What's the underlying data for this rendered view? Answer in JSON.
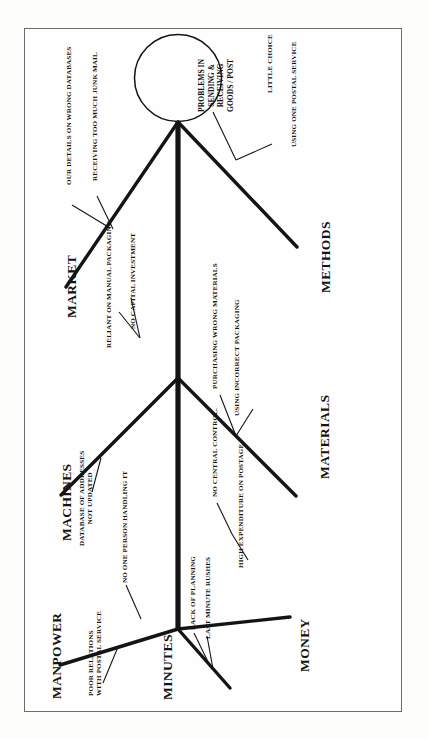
{
  "document": {
    "type": "fishbone-diagram",
    "alt_name": "Ishikawa cause-and-effect diagram",
    "orientation": "rotated-90-ccw",
    "page_border_color": "#6b6b6b",
    "ink_color": "#141414",
    "background_color": "#fefefe"
  },
  "effect": {
    "label": "PROBLEMS IN SENDING & RECEIVING GOODS / POST",
    "lines": [
      "PROBLEMS IN",
      "SENDING &",
      "RECEIVING",
      "GOODS / POST"
    ],
    "shape": "circle"
  },
  "categories": [
    {
      "id": "market",
      "label": "MARKET",
      "side": "upper-left",
      "causes": [
        {
          "label": "OUR DETAILS ON WRONG DATABASES"
        },
        {
          "label": "RECEIVING TOO MUCH JUNK MAIL"
        }
      ]
    },
    {
      "id": "methods",
      "label": "METHODS",
      "side": "upper-right",
      "causes": [
        {
          "label": "LITTLE CHOICE"
        },
        {
          "label": "USING ONE POSTAL SERVICE"
        }
      ]
    },
    {
      "id": "machines",
      "label": "MACHINES",
      "side": "middle-left",
      "causes": [
        {
          "label": "RELIANT ON MANUAL PACKAGING"
        },
        {
          "label": "NO CAPITAL INVESTMENT"
        },
        {
          "label": "DATABASE OF ADDRESSES NOT UPDATED"
        }
      ]
    },
    {
      "id": "materials",
      "label": "MATERIALS",
      "side": "middle-right",
      "causes": [
        {
          "label": "PURCHASING WRONG MATERIALS"
        },
        {
          "label": "USING INCORRECT PACKAGING"
        }
      ]
    },
    {
      "id": "manpower",
      "label": "MANPOWER",
      "side": "lower-left",
      "causes": [
        {
          "label": "POOR RELATIONS WITH POSTAL SERVICE"
        },
        {
          "label": "NO ONE PERSON HANDLING IT"
        }
      ]
    },
    {
      "id": "minutes",
      "label": "MINUTES",
      "side": "lower-spine",
      "causes": [
        {
          "label": "LACK OF PLANNING"
        },
        {
          "label": "LAST MINUTE RUSHES"
        }
      ]
    },
    {
      "id": "money",
      "label": "MONEY",
      "side": "lower-right",
      "causes": [
        {
          "label": "NO CENTRAL CONTROL."
        },
        {
          "label": "HIGH EXPENDITURE ON POSTAGE"
        }
      ]
    }
  ],
  "cause_text": {
    "manpower_line1": "POOR RELATIONS",
    "manpower_line2": "WITH POSTAL SERVICE",
    "machines_db_line1": "DATABASE OF ADDRESSES",
    "machines_db_line2": "NOT UPDATED"
  }
}
